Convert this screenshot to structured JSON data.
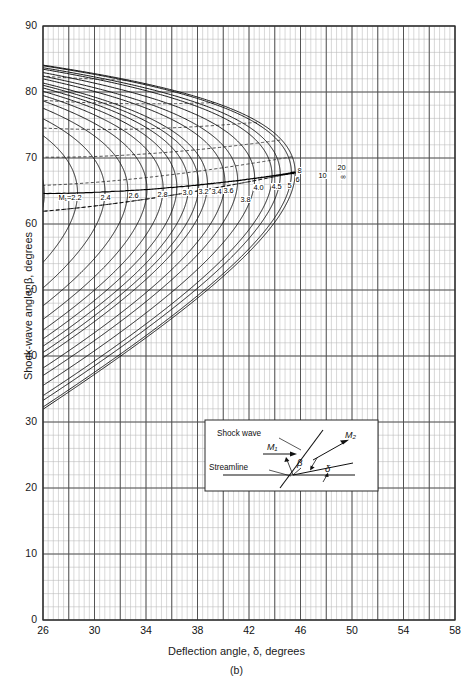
{
  "figure": {
    "caption": "(b)",
    "kind": "theta-beta-Mach oblique shock chart (detail, strong-shock region)"
  },
  "axes": {
    "x": {
      "title": "Deflection angle, δ, degrees",
      "title_symbol": "δ",
      "min": 26,
      "max": 58,
      "major_step": 4,
      "minor_step": 0.4,
      "ticks": [
        26,
        30,
        34,
        38,
        42,
        46,
        50,
        54,
        58
      ]
    },
    "y": {
      "title": "Shock-wave angle, β, degrees",
      "title_symbol": "β",
      "min": 0,
      "max": 90,
      "major_step": 10,
      "minor_step": 2,
      "ticks": [
        0,
        10,
        20,
        30,
        40,
        50,
        60,
        70,
        80,
        90
      ]
    }
  },
  "grid": {
    "minor_color": "#b8b8b8",
    "major_color": "#4d4d4d",
    "frame_color": "#2b2b2b",
    "show": true
  },
  "curve_style": {
    "solid_color": "#111111",
    "dashed_color": "#222222",
    "locus_color": "#000000"
  },
  "mach_labels": [
    {
      "text": "M₁=2.2",
      "x": 58,
      "y": 194
    },
    {
      "text": "2.4",
      "x": 100,
      "y": 194
    },
    {
      "text": "2.6",
      "x": 128,
      "y": 192
    },
    {
      "text": "2.8",
      "x": 157,
      "y": 191
    },
    {
      "text": "3.0",
      "x": 182,
      "y": 189
    },
    {
      "text": "3.2",
      "x": 198,
      "y": 188
    },
    {
      "text": "3.4",
      "x": 211,
      "y": 188
    },
    {
      "text": "3.6",
      "x": 223,
      "y": 187
    },
    {
      "text": "3.8",
      "x": 240,
      "y": 196
    },
    {
      "text": "4.0",
      "x": 253,
      "y": 184
    },
    {
      "text": "4.5",
      "x": 271,
      "y": 183
    },
    {
      "text": "5",
      "x": 287,
      "y": 182
    },
    {
      "text": "6",
      "x": 295,
      "y": 176
    },
    {
      "text": "8",
      "x": 297,
      "y": 167
    },
    {
      "text": "10",
      "x": 318,
      "y": 172
    },
    {
      "text": "20",
      "x": 337,
      "y": 164
    },
    {
      "text": "∞",
      "x": 340,
      "y": 173
    }
  ],
  "inset": {
    "labels": {
      "shock_wave": "Shock wave",
      "streamline": "Streamline",
      "m1": "M₁",
      "m2": "M₂",
      "beta": "β",
      "delta": "δ"
    },
    "box": {
      "x": 205,
      "y": 420,
      "w": 173,
      "h": 71
    }
  },
  "chart_data": {
    "type": "line",
    "title": "",
    "xlabel": "Deflection angle, δ, degrees",
    "ylabel": "Shock-wave angle, β, degrees",
    "xlim": [
      26,
      58
    ],
    "ylim": [
      0,
      90
    ],
    "grid": true,
    "legend": "inline curve labels",
    "gamma": 1.4,
    "series": [
      {
        "name": "M1=2.2",
        "label": "M₁=2.2",
        "delta_max": 26.4,
        "beta_at_max": 65.3,
        "style": "solid"
      },
      {
        "name": "M1=2.4",
        "label": "2.4",
        "delta_max": 29.8,
        "beta_at_max": 65.9,
        "style": "solid"
      },
      {
        "name": "M1=2.6",
        "label": "2.6",
        "delta_max": 32.4,
        "beta_at_max": 66.4,
        "style": "solid"
      },
      {
        "name": "M1=2.8",
        "label": "2.8",
        "delta_max": 34.7,
        "beta_at_max": 66.8,
        "style": "solid"
      },
      {
        "name": "M1=3.0",
        "label": "3.0",
        "delta_max": 36.7,
        "beta_at_max": 67.2,
        "style": "solid"
      },
      {
        "name": "M1=3.2",
        "label": "3.2",
        "delta_max": 38.3,
        "beta_at_max": 67.5,
        "style": "solid"
      },
      {
        "name": "M1=3.4",
        "label": "3.4",
        "delta_max": 39.7,
        "beta_at_max": 67.7,
        "style": "solid"
      },
      {
        "name": "M1=3.6",
        "label": "3.6",
        "delta_max": 40.9,
        "beta_at_max": 67.9,
        "style": "solid"
      },
      {
        "name": "M1=3.8",
        "label": "3.8",
        "delta_max": 42.0,
        "beta_at_max": 68.1,
        "style": "solid"
      },
      {
        "name": "M1=4.0",
        "label": "4.0",
        "delta_max": 42.9,
        "beta_at_max": 68.3,
        "style": "solid"
      },
      {
        "name": "M1=4.5",
        "label": "4.5",
        "delta_max": 44.7,
        "beta_at_max": 68.6,
        "style": "solid"
      },
      {
        "name": "M1=5",
        "label": "5",
        "delta_max": 45.9,
        "beta_at_max": 68.8,
        "style": "solid"
      },
      {
        "name": "M1=6",
        "label": "6",
        "delta_max": 47.6,
        "beta_at_max": 69.2,
        "style": "solid"
      },
      {
        "name": "M1=8",
        "label": "8",
        "delta_max": 49.5,
        "beta_at_max": 69.5,
        "style": "solid"
      },
      {
        "name": "M1=10",
        "label": "10",
        "delta_max": 50.5,
        "beta_at_max": 69.7,
        "style": "solid"
      },
      {
        "name": "M1=20",
        "label": "20",
        "delta_max": 51.9,
        "beta_at_max": 69.9,
        "style": "solid"
      },
      {
        "name": "M1=inf",
        "label": "∞",
        "delta_max": 52.4,
        "beta_at_max": 70.0,
        "style": "solid"
      }
    ],
    "mach_values": [
      2.2,
      2.4,
      2.6,
      2.8,
      3.0,
      3.2,
      3.4,
      3.6,
      3.8,
      4.0,
      4.5,
      5,
      6,
      8,
      10,
      20,
      1000
    ],
    "m2_dashed_values": [
      0.5,
      0.6,
      0.7,
      0.8,
      0.9,
      1.0
    ],
    "loci": [
      {
        "name": "maximum-deflection locus",
        "style": "solid"
      },
      {
        "name": "M2 = 1 locus",
        "style": "dashed"
      }
    ]
  }
}
